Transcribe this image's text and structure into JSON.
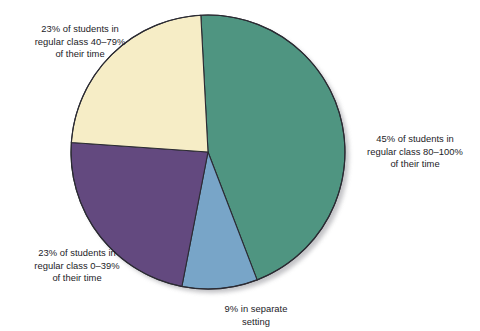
{
  "chart_data": {
    "type": "pie",
    "title": "",
    "subtitle": "",
    "xlabel": "",
    "ylabel": "",
    "legend_position": "none",
    "grid": false,
    "total": 100,
    "unit": "%",
    "slices": [
      {
        "key": "regular_80_100",
        "value": 45,
        "label": "45% of students in\nregular class 80–100%\nof their time",
        "color": "#4f9581",
        "start_angle": -3,
        "end_angle": 159
      },
      {
        "key": "separate_setting",
        "value": 9,
        "label": "9% in separate\nsetting",
        "color": "#78a5c8",
        "start_angle": 159,
        "end_angle": 191
      },
      {
        "key": "regular_0_39",
        "value": 23,
        "label": "23% of students in\nregular class 0–39%\nof their time",
        "color": "#63497f",
        "start_angle": 191,
        "end_angle": 274
      },
      {
        "key": "regular_40_79",
        "value": 23,
        "label": "23% of students in\nregular class 40–79%\nof their time",
        "color": "#f6edc6",
        "start_angle": 274,
        "end_angle": 357
      }
    ],
    "categories": [
      "45% of students in regular class 80–100% of their time",
      "9% in separate setting",
      "23% of students in regular class 0–39% of their time",
      "23% of students in regular class 40–79% of their time"
    ],
    "values": [
      45,
      9,
      23,
      23
    ],
    "colors": [
      "#4f9581",
      "#78a5c8",
      "#63497f",
      "#f6edc6"
    ],
    "outline_color": "#2b2b33",
    "background_color": "#ffffff",
    "shadow_color": "#b9b9bd"
  },
  "geometry": {
    "center_x": 208,
    "center_y": 152,
    "radius": 137
  }
}
